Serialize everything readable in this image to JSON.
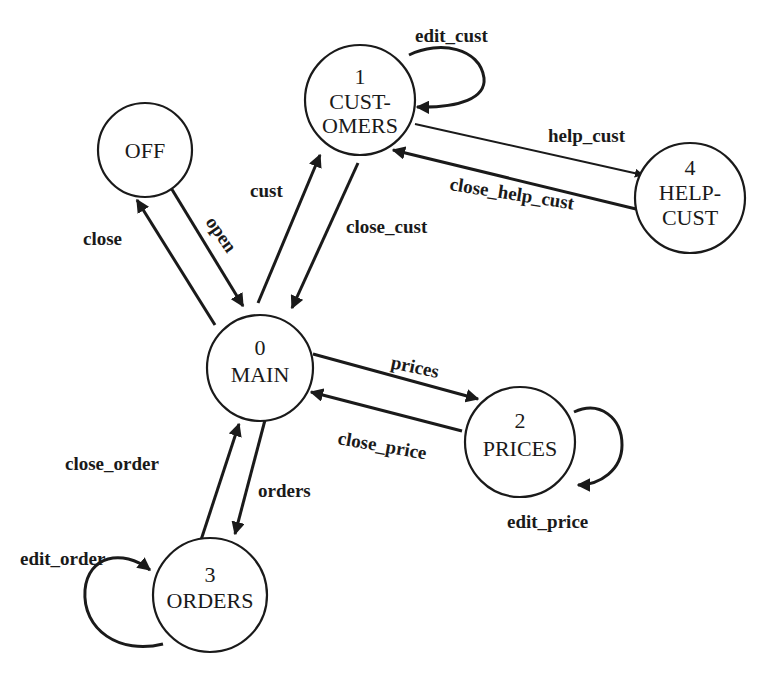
{
  "diagram": {
    "type": "state-transition",
    "nodes": [
      {
        "id": "off",
        "number": "",
        "line1": "OFF",
        "line2": ""
      },
      {
        "id": "main",
        "number": "0",
        "line1": "MAIN",
        "line2": ""
      },
      {
        "id": "customers",
        "number": "1",
        "line1": "CUST-",
        "line2": "OMERS"
      },
      {
        "id": "prices",
        "number": "2",
        "line1": "PRICES",
        "line2": ""
      },
      {
        "id": "orders",
        "number": "3",
        "line1": "ORDERS",
        "line2": ""
      },
      {
        "id": "helpcust",
        "number": "4",
        "line1": "HELP-",
        "line2": "CUST"
      }
    ],
    "edges": [
      {
        "from": "main",
        "to": "off",
        "label": "close"
      },
      {
        "from": "off",
        "to": "main",
        "label": "open"
      },
      {
        "from": "main",
        "to": "customers",
        "label": "cust"
      },
      {
        "from": "customers",
        "to": "main",
        "label": "close_cust"
      },
      {
        "from": "customers",
        "to": "customers",
        "label": "edit_cust"
      },
      {
        "from": "customers",
        "to": "helpcust",
        "label": "help_cust"
      },
      {
        "from": "helpcust",
        "to": "customers",
        "label": "close_help_cust"
      },
      {
        "from": "main",
        "to": "prices",
        "label": "prices"
      },
      {
        "from": "prices",
        "to": "main",
        "label": "close_price"
      },
      {
        "from": "prices",
        "to": "prices",
        "label": "edit_price"
      },
      {
        "from": "main",
        "to": "orders",
        "label": "orders"
      },
      {
        "from": "orders",
        "to": "main",
        "label": "close_order"
      },
      {
        "from": "orders",
        "to": "orders",
        "label": "edit_order"
      }
    ]
  }
}
